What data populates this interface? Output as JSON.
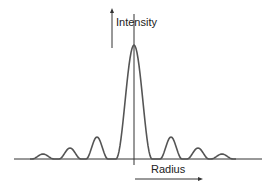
{
  "diagram": {
    "y_axis_label": "Intensity",
    "x_axis_label": "Radius",
    "line_color": "#555555",
    "axis_color": "#333333",
    "peaks": [
      {
        "x": 43,
        "h": 5
      },
      {
        "x": 70,
        "h": 11
      },
      {
        "x": 97,
        "h": 22
      },
      {
        "x": 134,
        "h": 114
      },
      {
        "x": 171,
        "h": 22
      },
      {
        "x": 198,
        "h": 11
      },
      {
        "x": 222,
        "h": 5
      }
    ]
  }
}
